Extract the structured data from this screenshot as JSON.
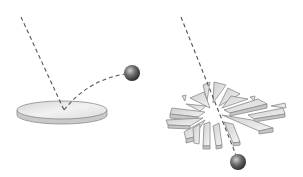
{
  "diagram": {
    "panels": [
      {
        "id": "intact",
        "caption": "Intact disc: ball deflects off surface",
        "disc": {
          "cx": 62,
          "cy": 110,
          "rx": 45,
          "ry": 9,
          "thickness": 5
        },
        "incoming_path": {
          "x1": 21,
          "y1": 17,
          "x2": 64,
          "y2": 110
        },
        "deflected_path": "M64,110 Q88,80 125,74",
        "ball": {
          "cx": 132,
          "cy": 73,
          "r": 8
        }
      },
      {
        "id": "shattered",
        "caption": "Shattered disc: ball passes through",
        "center": {
          "cx": 216,
          "cy": 112
        },
        "incoming_path": {
          "x1": 181,
          "y1": 17,
          "x2": 236,
          "y2": 155
        },
        "ball": {
          "cx": 238,
          "cy": 162,
          "r": 8
        }
      }
    ],
    "colors": {
      "line": "#555555",
      "disc_top": "#e4e4e4",
      "disc_edge": "#c8c8c8",
      "disc_stroke": "#8a8a8a",
      "ball_dark": "#2a2a2a",
      "ball_light": "#bdbdbd"
    }
  }
}
